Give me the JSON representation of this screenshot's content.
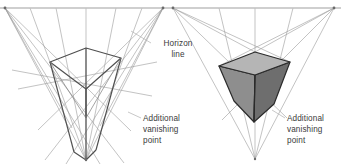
{
  "figure": {
    "background_color": "#ffffff",
    "width": 341,
    "height": 164
  },
  "labels": {
    "horizon": "Horizon\nline",
    "horizon_line_1": "Horizon",
    "horizon_line_2": "line",
    "additional_vp_left_line_1": "Additional",
    "additional_vp_left_line_2": "vanishing",
    "additional_vp_left_line_3": "point",
    "additional_vp_right_line_1": "Additional",
    "additional_vp_right_line_2": "vanishing",
    "additional_vp_right_line_3": "point"
  },
  "colors": {
    "horizon_line": "#bfbfbf",
    "construction_line": "#9a9a9a",
    "wireframe_line": "#555555",
    "box_outline": "#2b2b2b",
    "box_top_face": "#b5b5b5",
    "box_left_face": "#8e8e8e",
    "box_right_face": "#6e6e6e",
    "leader_line": "#b0b0b0",
    "text": "#3b3b3b"
  },
  "geometry": {
    "left_diagram": {
      "vanishing_point_left": [
        5,
        8
      ],
      "vanishing_point_right": [
        163,
        8
      ],
      "vanishing_point_bottom": [
        86,
        160
      ],
      "box_top_apex": [
        86,
        48
      ],
      "box_top_left": [
        50,
        62
      ],
      "box_top_right": [
        121,
        58
      ],
      "box_center": [
        86,
        71
      ],
      "box_bottom": [
        86,
        118
      ]
    },
    "right_diagram": {
      "vanishing_point_left": [
        173,
        8
      ],
      "vanishing_point_right": [
        334,
        8
      ],
      "vanishing_point_bottom": [
        255,
        159
      ],
      "box_top_apex": [
        255,
        52
      ],
      "box_top_left": [
        219,
        66
      ],
      "box_top_right": [
        290,
        62
      ],
      "box_center": [
        255,
        75
      ],
      "box_bottom": [
        254,
        122
      ]
    }
  }
}
